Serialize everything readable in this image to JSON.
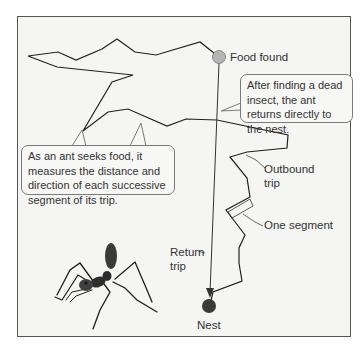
{
  "figure": {
    "labels": {
      "food_found": "Food found",
      "outbound_trip_line1": "Outbound",
      "outbound_trip_line2": "trip",
      "one_segment": "One segment",
      "return_trip_line1": "Return",
      "return_trip_line2": "trip",
      "nest": "Nest"
    },
    "callouts": {
      "return_note": "After finding a dead insect, the ant returns directly to the nest.",
      "seek_note": "As an ant seeks food, it measures the distance and direction of each successive segment of its trip."
    },
    "colors": {
      "background": "#f5f5f4",
      "frame_border": "#555555",
      "path": "#222222",
      "food_marker": "#b5b5b5",
      "nest_marker": "#3a3a3a",
      "callout_border": "#7a7a7a"
    }
  }
}
